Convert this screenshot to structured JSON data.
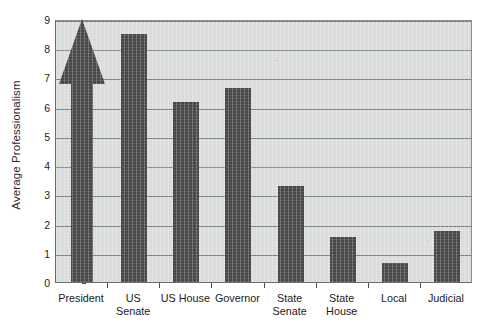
{
  "chart_data": {
    "type": "bar",
    "title": "",
    "xlabel": "",
    "ylabel": "Average Professionalism",
    "ylim": [
      0,
      9
    ],
    "yticks": [
      0,
      1,
      2,
      3,
      4,
      5,
      6,
      7,
      8,
      9
    ],
    "ytick_labels": [
      "0",
      "1",
      "2",
      "3",
      "4",
      "5",
      "6",
      "7",
      "8",
      "9"
    ],
    "grid": true,
    "legend": "none",
    "categories": [
      "President",
      "US Senate",
      "US House",
      "Governor",
      "State Senate",
      "State House",
      "Local",
      "Judicial"
    ],
    "category_lines": [
      [
        "President",
        ""
      ],
      [
        "US",
        "Senate"
      ],
      [
        "US House",
        ""
      ],
      [
        "Governor",
        ""
      ],
      [
        "State",
        "Senate"
      ],
      [
        "State",
        "House"
      ],
      [
        "Local",
        ""
      ],
      [
        "Judicial",
        ""
      ]
    ],
    "values": [
      9.0,
      8.5,
      6.15,
      6.65,
      3.3,
      1.55,
      0.65,
      1.75
    ],
    "value_notes": [
      "off-scale, drawn as upward arrow reaching top of axis",
      "",
      "",
      "",
      "",
      "",
      "",
      ""
    ],
    "bar_styles": [
      "arrow",
      "bar",
      "bar",
      "bar",
      "bar",
      "bar",
      "bar",
      "bar"
    ],
    "colors": {
      "bar": "#494649",
      "plot_background": "#d9dcda",
      "gridline": "#7b7f7d",
      "axis": "#6b6b6b",
      "text": "#1c1c1c",
      "page_background": "#ffffff"
    }
  }
}
